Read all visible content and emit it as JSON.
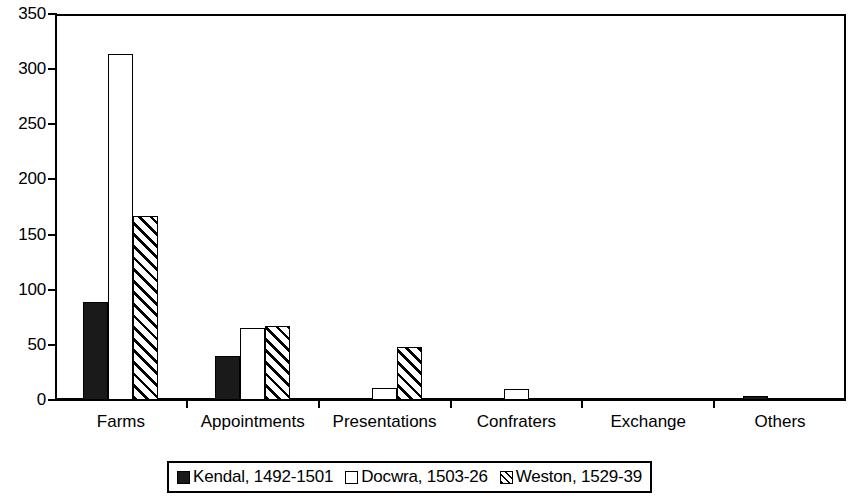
{
  "chart_data": {
    "type": "bar",
    "title": "",
    "xlabel": "",
    "ylabel": "",
    "ylim": [
      0,
      350
    ],
    "ytick_step": 50,
    "yticks": [
      "0",
      "50",
      "100",
      "150",
      "200",
      "250",
      "300",
      "350"
    ],
    "grid": false,
    "legend_position": "bottom",
    "categories": [
      "Farms",
      "Appointments",
      "Presentations",
      "Confraters",
      "Exchange",
      "Others"
    ],
    "series": [
      {
        "name": "Kendal, 1492-1501",
        "swatch": "solid-black-square",
        "color": "#1a1a1a",
        "values": [
          89,
          40,
          1,
          1,
          0,
          4
        ]
      },
      {
        "name": "Docwra, 1503-26",
        "swatch": "open-white-square",
        "color": "#ffffff",
        "values": [
          314,
          65,
          11,
          10,
          1,
          0
        ]
      },
      {
        "name": "Weston, 1529-39",
        "swatch": "diagonal-hatched-square",
        "color": "#ffffff",
        "values": [
          167,
          67,
          48,
          2,
          1,
          1
        ]
      }
    ]
  },
  "axis": {
    "frame_color": "#000000"
  }
}
